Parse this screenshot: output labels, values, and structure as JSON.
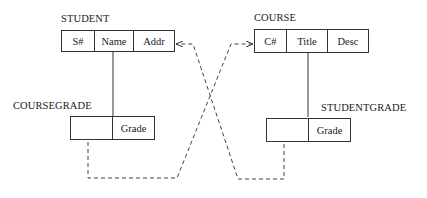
{
  "diagram": {
    "relations": {
      "student": {
        "name": "STUDENT",
        "attributes": [
          "S#",
          "Name",
          "Addr"
        ]
      },
      "course": {
        "name": "COURSE",
        "attributes": [
          "C#",
          "Title",
          "Desc"
        ]
      },
      "coursegrade": {
        "name": "COURSEGRADE",
        "attributes": [
          "",
          "Grade"
        ]
      },
      "studentgrade": {
        "name": "STUDENTGRADE",
        "attributes": [
          "",
          "Grade"
        ]
      }
    },
    "links": [
      {
        "from": "STUDENT.Name",
        "to": "COURSEGRADE",
        "style": "solid"
      },
      {
        "from": "COURSE.Title",
        "to": "STUDENTGRADE",
        "style": "solid"
      },
      {
        "from": "COURSEGRADE.key",
        "to": "COURSE.C#",
        "style": "dashed-arrow"
      },
      {
        "from": "STUDENTGRADE.key",
        "to": "STUDENT.Addr",
        "style": "dashed-arrow"
      }
    ]
  }
}
